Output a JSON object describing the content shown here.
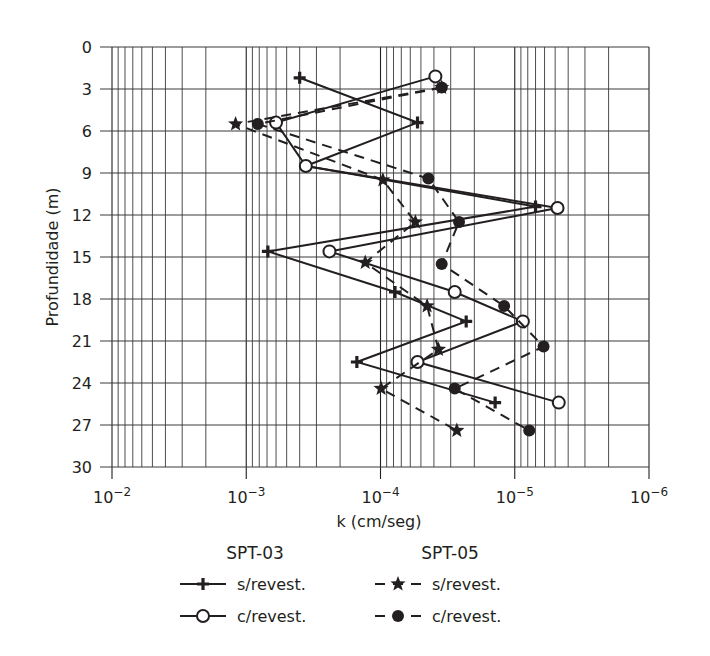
{
  "chart_data": {
    "type": "line",
    "orientation": "depth-profile",
    "title": "",
    "xlabel": "k (cm/seg)",
    "ylabel": "Profundidade (m)",
    "x_scale": "log-reversed",
    "xlim": [
      0.01,
      1e-06
    ],
    "x_ticks": [
      {
        "value": 0.01,
        "base": "10",
        "exp": "−2"
      },
      {
        "value": 0.001,
        "base": "10",
        "exp": "−3"
      },
      {
        "value": 0.0001,
        "base": "10",
        "exp": "−4"
      },
      {
        "value": 1e-05,
        "base": "10",
        "exp": "−5"
      },
      {
        "value": 1e-06,
        "base": "10",
        "exp": "−6"
      }
    ],
    "ylim": [
      0,
      30
    ],
    "y_inverted": true,
    "y_ticks": [
      0,
      3,
      6,
      9,
      12,
      15,
      18,
      21,
      24,
      27,
      30
    ],
    "grid": true,
    "legend_position": "bottom",
    "series": [
      {
        "name": "s/revest.",
        "group": "SPT-03",
        "marker": "plus",
        "line": "solid",
        "points": [
          {
            "depth": 2.2,
            "k": 0.0004
          },
          {
            "depth": 5.4,
            "k": 5.3e-05
          },
          {
            "depth": 8.5,
            "k": 0.00036
          },
          {
            "depth": 11.4,
            "k": 7e-06
          },
          {
            "depth": 14.6,
            "k": 0.00069
          },
          {
            "depth": 17.5,
            "k": 7.8e-05
          },
          {
            "depth": 19.6,
            "k": 2.3e-05
          },
          {
            "depth": 22.5,
            "k": 0.00015
          },
          {
            "depth": 25.4,
            "k": 1.4e-05
          }
        ]
      },
      {
        "name": "c/revest.",
        "group": "SPT-03",
        "marker": "open-circle",
        "line": "solid",
        "points": [
          {
            "depth": 2.1,
            "k": 3.9e-05
          },
          {
            "depth": 5.4,
            "k": 0.0006
          },
          {
            "depth": 8.5,
            "k": 0.00036
          },
          {
            "depth": 11.5,
            "k": 4.8e-06
          },
          {
            "depth": 14.6,
            "k": 0.00024
          },
          {
            "depth": 17.5,
            "k": 2.8e-05
          },
          {
            "depth": 19.6,
            "k": 8.7e-06
          },
          {
            "depth": 22.5,
            "k": 5.3e-05
          },
          {
            "depth": 25.4,
            "k": 4.7e-06
          }
        ]
      },
      {
        "name": "s/revest.",
        "group": "SPT-05",
        "marker": "star",
        "line": "dashed",
        "points": [
          {
            "depth": 2.9,
            "k": 3.5e-05
          },
          {
            "depth": 5.5,
            "k": 0.0012
          },
          {
            "depth": 9.5,
            "k": 9.6e-05
          },
          {
            "depth": 12.5,
            "k": 5.5e-05
          },
          {
            "depth": 15.4,
            "k": 0.00013
          },
          {
            "depth": 18.5,
            "k": 4.5e-05
          },
          {
            "depth": 21.6,
            "k": 3.7e-05
          },
          {
            "depth": 24.4,
            "k": 9.9e-05
          },
          {
            "depth": 27.4,
            "k": 2.7e-05
          }
        ]
      },
      {
        "name": "c/revest.",
        "group": "SPT-05",
        "marker": "filled-circle",
        "line": "dashed",
        "points": [
          {
            "depth": 2.9,
            "k": 3.5e-05
          },
          {
            "depth": 5.5,
            "k": 0.00082
          },
          {
            "depth": 9.4,
            "k": 4.4e-05
          },
          {
            "depth": 12.5,
            "k": 2.6e-05
          },
          {
            "depth": 15.5,
            "k": 3.5e-05
          },
          {
            "depth": 18.5,
            "k": 1.2e-05
          },
          {
            "depth": 21.4,
            "k": 6.1e-06
          },
          {
            "depth": 24.4,
            "k": 2.8e-05
          },
          {
            "depth": 27.4,
            "k": 7.8e-06
          }
        ]
      }
    ]
  },
  "legend": {
    "groups": [
      {
        "title": "SPT-03",
        "items": [
          {
            "label": "s/revest.",
            "marker": "plus",
            "line": "solid"
          },
          {
            "label": "c/revest.",
            "marker": "open-circle",
            "line": "solid"
          }
        ]
      },
      {
        "title": "SPT-05",
        "items": [
          {
            "label": "s/revest.",
            "marker": "star",
            "line": "dashed"
          },
          {
            "label": "c/revest.",
            "marker": "filled-circle",
            "line": "dashed"
          }
        ]
      }
    ]
  },
  "colors": {
    "ink": "#231f20",
    "grid": "#3a3a3a",
    "background": "#ffffff"
  }
}
